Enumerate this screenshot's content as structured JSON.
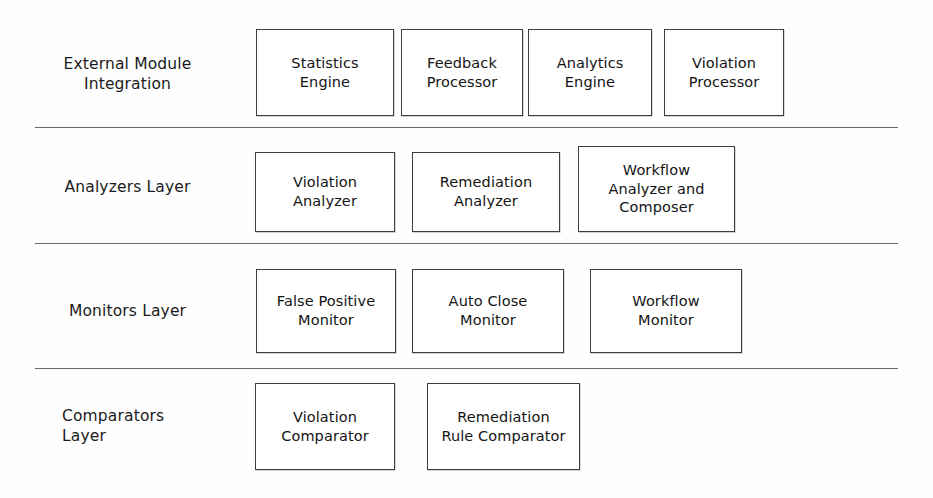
{
  "diagram": {
    "background_color": "#fefefe",
    "border_color": "#3d3d3d",
    "text_color": "#141414",
    "separator_color": "#4a4a4a"
  },
  "layers": [
    {
      "id": "external-module-integration",
      "label": "External Module\nIntegration",
      "label_align": "center",
      "nodes": [
        {
          "id": "statistics-engine",
          "label": "Statistics\nEngine"
        },
        {
          "id": "feedback-processor",
          "label": "Feedback\nProcessor"
        },
        {
          "id": "analytics-engine",
          "label": "Analytics\nEngine"
        },
        {
          "id": "violation-processor",
          "label": "Violation\nProcessor"
        }
      ]
    },
    {
      "id": "analyzers-layer",
      "label": "Analyzers Layer",
      "label_align": "center",
      "nodes": [
        {
          "id": "violation-analyzer",
          "label": "Violation\nAnalyzer"
        },
        {
          "id": "remediation-analyzer",
          "label": "Remediation\nAnalyzer"
        },
        {
          "id": "workflow-analyzer-and-composer",
          "label": "Workflow\nAnalyzer and\nComposer"
        }
      ]
    },
    {
      "id": "monitors-layer",
      "label": "Monitors Layer",
      "label_align": "center",
      "nodes": [
        {
          "id": "false-positive-monitor",
          "label": "False Positive\nMonitor"
        },
        {
          "id": "auto-close-monitor",
          "label": "Auto Close\nMonitor"
        },
        {
          "id": "workflow-monitor",
          "label": "Workflow\nMonitor"
        }
      ]
    },
    {
      "id": "comparators-layer",
      "label": "Comparators\nLayer",
      "label_align": "left",
      "nodes": [
        {
          "id": "violation-comparator",
          "label": "Violation\nComparator"
        },
        {
          "id": "remediation-rule-comparator",
          "label": "Remediation\nRule Comparator"
        }
      ]
    }
  ]
}
